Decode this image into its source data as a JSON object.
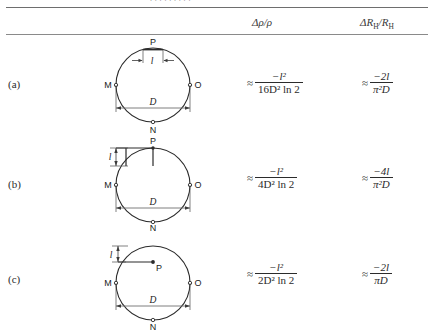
{
  "page": {
    "cropped_top_text": ". . . .  . . . . .",
    "columns": [
      {
        "id": "delta-rho",
        "label": "Δρ/ρ"
      },
      {
        "id": "delta-rh",
        "label": "ΔRₕ/Rₕ"
      }
    ]
  },
  "rows": [
    {
      "label": "(a)",
      "diagram": {
        "name": "circle-contact-arc-top",
        "points": [
          "P",
          "M",
          "O",
          "N"
        ],
        "length_label": "l",
        "diameter_label": "D"
      },
      "delta_rho": {
        "approx": "≈",
        "numerator": "−l²",
        "denominator": "16D² ln 2"
      },
      "delta_rh": {
        "approx": "≈",
        "numerator": "−2l",
        "denominator": "π²D"
      }
    },
    {
      "label": "(b)",
      "diagram": {
        "name": "circle-contact-radial-slit",
        "points": [
          "P",
          "M",
          "O",
          "N"
        ],
        "length_label": "l",
        "diameter_label": "D"
      },
      "delta_rho": {
        "approx": "≈",
        "numerator": "−l²",
        "denominator": "4D² ln 2"
      },
      "delta_rh": {
        "approx": "≈",
        "numerator": "−4l",
        "denominator": "π²D"
      }
    },
    {
      "label": "(c)",
      "diagram": {
        "name": "circle-contact-interior-point",
        "points": [
          "P",
          "M",
          "O",
          "N"
        ],
        "length_label": "l",
        "diameter_label": "D"
      },
      "delta_rho": {
        "approx": "≈",
        "numerator": "−l²",
        "denominator": "2D² ln 2"
      },
      "delta_rh": {
        "approx": "≈",
        "numerator": "−2l",
        "denominator": "πD"
      }
    }
  ],
  "colors": {
    "rule": "#7a7a7a",
    "ink": "#1a1a1a",
    "circle_stroke": "#2b2b2b",
    "dimension_line": "#6f6f6f"
  }
}
